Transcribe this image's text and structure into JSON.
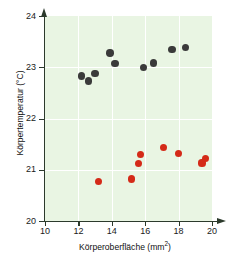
{
  "chart_data": {
    "type": "scatter",
    "title": "",
    "xlabel": "Körperoberfläche (mm2)",
    "xlabel_base": "Körperoberfläche (mm",
    "xlabel_sup": "2",
    "xlabel_close": ")",
    "ylabel": "Körpertemperatur (°C)",
    "xlim": [
      10,
      20
    ],
    "ylim": [
      20,
      24
    ],
    "xticks": [
      10,
      12,
      14,
      16,
      18,
      20
    ],
    "yticks": [
      20,
      21,
      22,
      23,
      24
    ],
    "xtick_labels": [
      "10",
      "12",
      "14",
      "16",
      "18",
      "20"
    ],
    "ytick_labels": [
      "20",
      "21",
      "22",
      "23",
      "24"
    ],
    "grid": true,
    "grid_color": "#ffffff",
    "plot_background": "#e9f5e3",
    "legend": "none",
    "series": [
      {
        "name": "dark-series",
        "color": "#3a3a3a",
        "points": [
          {
            "x": 12.2,
            "y": 22.83
          },
          {
            "x": 12.6,
            "y": 22.73
          },
          {
            "x": 13.0,
            "y": 22.88
          },
          {
            "x": 13.9,
            "y": 23.28
          },
          {
            "x": 14.2,
            "y": 23.07
          },
          {
            "x": 15.9,
            "y": 23.0
          },
          {
            "x": 16.5,
            "y": 23.08
          },
          {
            "x": 17.6,
            "y": 23.35
          },
          {
            "x": 18.4,
            "y": 23.38
          }
        ]
      },
      {
        "name": "red-series",
        "color": "#d42a18",
        "points": [
          {
            "x": 13.2,
            "y": 20.77
          },
          {
            "x": 15.2,
            "y": 20.82
          },
          {
            "x": 15.6,
            "y": 21.12
          },
          {
            "x": 15.7,
            "y": 21.3
          },
          {
            "x": 17.1,
            "y": 21.43
          },
          {
            "x": 18.0,
            "y": 21.32
          },
          {
            "x": 19.4,
            "y": 21.13
          },
          {
            "x": 19.6,
            "y": 21.22
          }
        ]
      }
    ]
  }
}
